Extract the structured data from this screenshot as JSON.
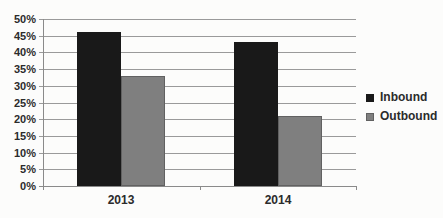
{
  "chart_data": {
    "type": "bar",
    "title": "",
    "xlabel": "",
    "ylabel": "",
    "categories": [
      "2013",
      "2014"
    ],
    "series": [
      {
        "name": "Inbound",
        "values": [
          46,
          43
        ],
        "color": "#191919",
        "border": "#191919"
      },
      {
        "name": "Outbound",
        "values": [
          33,
          21
        ],
        "color": "#7f7f7f",
        "border": "#616161"
      }
    ],
    "ylim": [
      0,
      50
    ],
    "ytick_step": 5,
    "ytick_suffix": "%",
    "grid": true,
    "legend_position": "right"
  },
  "colors": {
    "background": "#fcfcfb",
    "gridline": "#9a9a9a",
    "axis": "#8a8a8a",
    "text": "#2b2b2b"
  }
}
